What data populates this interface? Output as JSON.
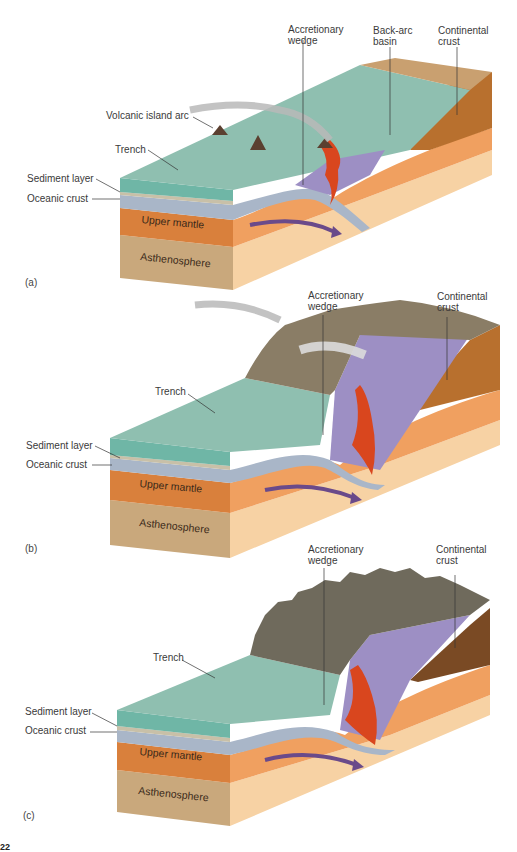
{
  "figure": {
    "panels": [
      {
        "id": "a",
        "panel_label": "(a)",
        "labels": {
          "accretionary_wedge": [
            "Accretionary",
            "wedge"
          ],
          "back_arc_basin": [
            "Back-arc",
            "basin"
          ],
          "continental_crust": [
            "Continental",
            "crust"
          ],
          "volcanic_island_arc": "Volcanic island arc",
          "trench": "Trench",
          "sediment_layer": "Sediment layer",
          "oceanic_crust": "Oceanic crust",
          "upper_mantle": "Upper mantle",
          "asthenosphere": "Asthenosphere"
        }
      },
      {
        "id": "b",
        "panel_label": "(b)",
        "labels": {
          "accretionary_wedge": [
            "Accretionary",
            "wedge"
          ],
          "continental_crust": [
            "Continental",
            "crust"
          ],
          "trench": "Trench",
          "sediment_layer": "Sediment layer",
          "oceanic_crust": "Oceanic crust",
          "upper_mantle": "Upper mantle",
          "asthenosphere": "Asthenosphere"
        }
      },
      {
        "id": "c",
        "panel_label": "(c)",
        "labels": {
          "accretionary_wedge": [
            "Accretionary",
            "wedge"
          ],
          "continental_crust": [
            "Continental",
            "crust"
          ],
          "trench": "Trench",
          "sediment_layer": "Sediment layer",
          "oceanic_crust": "Oceanic crust",
          "upper_mantle": "Upper mantle",
          "asthenosphere": "Asthenosphere"
        }
      }
    ],
    "page_number_fragment": "22",
    "colors": {
      "ocean_top": "#8fbfb0",
      "ocean_side": "#5fae9c",
      "oceanic_crust": "#a9b6c8",
      "upper_mantle_front": "#d9803c",
      "upper_mantle_side": "#f0a060",
      "asthenosphere_front": "#c9a87c",
      "asthenosphere_side": "#f7d2a4",
      "continental_crust": "#b8702e",
      "wedge_purple": "#9d8fc4",
      "magma": "#d9461e",
      "mountains": "#7a7060",
      "arrow": "#6a4a8a"
    }
  }
}
